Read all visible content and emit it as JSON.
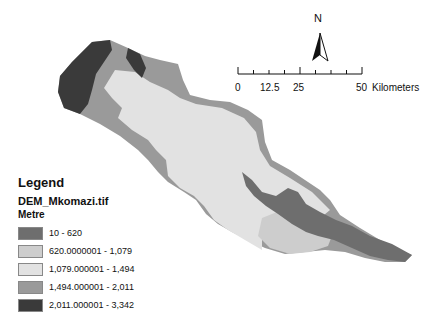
{
  "map": {
    "north_arrow": {
      "label": "N"
    },
    "scale_bar": {
      "ticks": [
        "0",
        "12.5",
        "25",
        "50"
      ],
      "unit": "Kilometers"
    },
    "legend": {
      "title": "Legend",
      "layer": "DEM_Mkomazi.tif",
      "unit": "Metre",
      "classes": [
        {
          "label": "10 - 620",
          "color": "#6e6e6e"
        },
        {
          "label": "620.0000001 - 1,079",
          "color": "#cdcdcd"
        },
        {
          "label": "1,079.000001 - 1,494",
          "color": "#e2e2e2"
        },
        {
          "label": "1,494.000001 - 2,011",
          "color": "#9a9a9a"
        },
        {
          "label": "2,011.000001 - 3,342",
          "color": "#3a3a3a"
        }
      ]
    }
  }
}
